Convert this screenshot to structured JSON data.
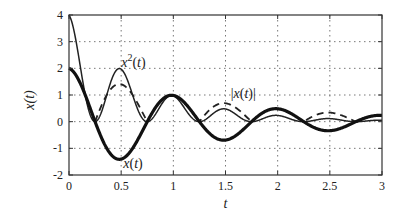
{
  "chart_data": {
    "type": "line",
    "title": "",
    "xlabel": "t",
    "ylabel": "x(t)",
    "xlim": [
      0,
      3
    ],
    "ylim": [
      -2,
      4
    ],
    "xticks": [
      0,
      0.5,
      1,
      1.5,
      2,
      2.5,
      3
    ],
    "xtick_labels": [
      "0",
      "0.5",
      "1",
      "1.5",
      "2",
      "2.5",
      "3"
    ],
    "yticks": [
      -2,
      -1,
      0,
      1,
      2,
      3,
      4
    ],
    "ytick_labels": [
      "-2",
      "-1",
      "0",
      "1",
      "2",
      "3",
      "4"
    ],
    "grid": true,
    "legend": null,
    "series": [
      {
        "name": "x(t)",
        "style": "thick-solid",
        "x": [
          0,
          0.25,
          0.5,
          0.75,
          1.0,
          1.25,
          1.5,
          1.75,
          2.0,
          2.25,
          2.5,
          2.75,
          3.0
        ],
        "values": [
          2.0,
          0.0,
          -1.4,
          0.0,
          0.98,
          0.0,
          -0.69,
          0.0,
          0.48,
          0.0,
          -0.34,
          0.0,
          0.24
        ]
      },
      {
        "name": "x^2(t)",
        "style": "thin-solid",
        "x": [
          0,
          0.25,
          0.5,
          0.75,
          1.0,
          1.25,
          1.5,
          1.75,
          2.0,
          2.25,
          2.5,
          2.75,
          3.0
        ],
        "values": [
          4.0,
          0.0,
          1.96,
          0.0,
          0.96,
          0.0,
          0.47,
          0.0,
          0.23,
          0.0,
          0.11,
          0.0,
          0.06
        ]
      },
      {
        "name": "|x(t)|",
        "style": "dashed",
        "x": [
          0,
          0.25,
          0.5,
          0.75,
          1.0,
          1.25,
          1.5,
          1.75,
          2.0,
          2.25,
          2.5,
          2.75,
          3.0
        ],
        "values": [
          2.0,
          0.0,
          1.4,
          0.0,
          0.98,
          0.0,
          0.69,
          0.0,
          0.48,
          0.0,
          0.34,
          0.0,
          0.24
        ]
      }
    ],
    "model": {
      "amplitude": 2.0,
      "decay": 0.71,
      "frequency_hz": 1.0
    },
    "annotations": [
      {
        "text_base": "x",
        "text_sup": "2",
        "text_tail": "(t)",
        "x": 0.5,
        "y": 2.05,
        "target_series": "x^2(t)"
      },
      {
        "text": "|x(t)|",
        "x": 1.55,
        "y": 0.9,
        "target_series": "|x(t)|"
      },
      {
        "text": "x(t)",
        "x": 0.52,
        "y": -1.75,
        "target_series": "x(t)"
      }
    ]
  },
  "layout": {
    "plot_left": 69,
    "plot_right": 382,
    "plot_top": 15,
    "plot_bottom": 175
  }
}
